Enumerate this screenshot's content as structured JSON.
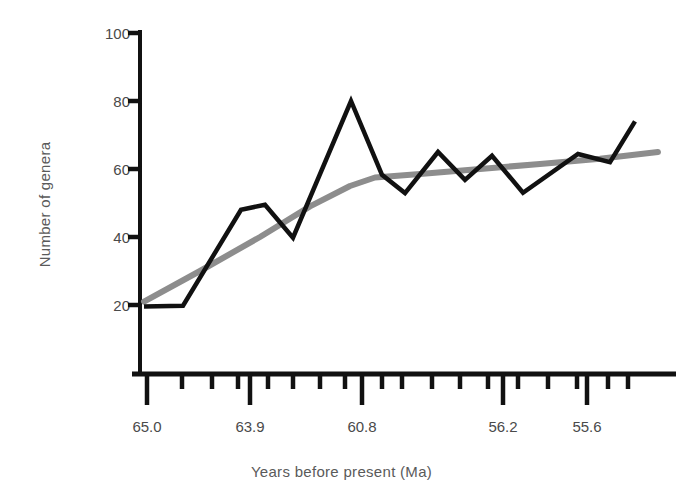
{
  "chart_data": {
    "type": "line",
    "title": "",
    "xlabel": "Years before present (Ma)",
    "ylabel": "Number of genera",
    "ylim": [
      0,
      100
    ],
    "grid": false,
    "legend": null,
    "y_ticks": [
      20,
      40,
      60,
      80,
      100
    ],
    "y_tick_labels": [
      "20",
      "40",
      "60",
      "80",
      "100"
    ],
    "x_tick_labels": [
      "65.0",
      "63.9",
      "60.8",
      "56.2",
      "55.6"
    ],
    "x_major_tick_pixels": [
      147,
      250,
      362,
      503,
      587
    ],
    "x_minor_tick_pixels": [
      182,
      212,
      238,
      268,
      293,
      320,
      345,
      382,
      402,
      432,
      460,
      488,
      518,
      548,
      577,
      608,
      628
    ],
    "axis_note": "x axis is a non-uniform stratigraphic time scale; labels mark selected stage boundaries",
    "series": [
      {
        "name": "Number of genera",
        "color": "#111111",
        "style": "zigzag",
        "x_pixels": [
          144,
          183,
          241,
          265,
          293,
          351,
          382,
          405,
          438,
          465,
          492,
          523,
          578,
          610,
          635
        ],
        "values": [
          19.6,
          19.8,
          48,
          49.5,
          39.8,
          80,
          58.3,
          52.9,
          65,
          56.8,
          63.9,
          53,
          64.4,
          62,
          74
        ]
      },
      {
        "name": "Trend (smoothed)",
        "color": "#8d8d8d",
        "style": "smooth",
        "x_pixels": [
          144,
          200,
          260,
          310,
          350,
          375,
          420,
          480,
          540,
          600,
          658
        ],
        "values": [
          21,
          30,
          40,
          49,
          55,
          57.5,
          58.5,
          60,
          61.5,
          63,
          65
        ]
      }
    ]
  }
}
